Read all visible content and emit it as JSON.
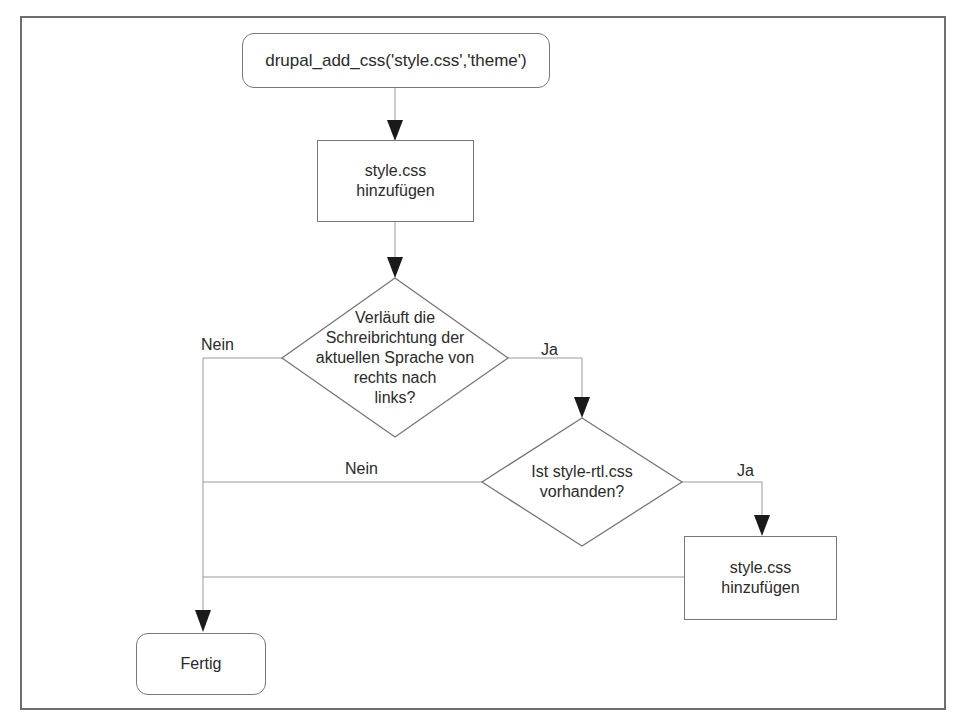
{
  "diagram": {
    "type": "flowchart",
    "nodes": {
      "start": {
        "shape": "rounded-rect",
        "text": "drupal_add_css('style.css','theme')"
      },
      "add_style_1": {
        "shape": "rect",
        "line1": "style.css",
        "line2": "hinzufügen"
      },
      "decision_rtl": {
        "shape": "diamond",
        "line1": "Verläuft die",
        "line2": "Schreibrichtung der",
        "line3": "aktuellen Sprache von",
        "line4": "rechts nach",
        "line5": "links?"
      },
      "decision_file": {
        "shape": "diamond",
        "line1": "Ist style-rtl.css",
        "line2": "vorhanden?"
      },
      "add_style_2": {
        "shape": "rect",
        "line1": "style.css",
        "line2": "hinzufügen"
      },
      "end": {
        "shape": "rounded-rect",
        "text": "Fertig"
      }
    },
    "edge_labels": {
      "rtl_no": "Nein",
      "rtl_yes": "Ja",
      "file_no": "Nein",
      "file_yes": "Ja"
    },
    "edges": [
      {
        "from": "start",
        "to": "add_style_1"
      },
      {
        "from": "add_style_1",
        "to": "decision_rtl"
      },
      {
        "from": "decision_rtl",
        "to": "end",
        "label": "Nein"
      },
      {
        "from": "decision_rtl",
        "to": "decision_file",
        "label": "Ja"
      },
      {
        "from": "decision_file",
        "to": "end",
        "label": "Nein"
      },
      {
        "from": "decision_file",
        "to": "add_style_2",
        "label": "Ja"
      },
      {
        "from": "add_style_2",
        "to": "end"
      }
    ],
    "colors": {
      "line": "#8a8a8a",
      "border": "#777777",
      "frame": "#6e6e6e",
      "arrow": "#1a1a1a",
      "text": "#2a2a2a"
    }
  }
}
